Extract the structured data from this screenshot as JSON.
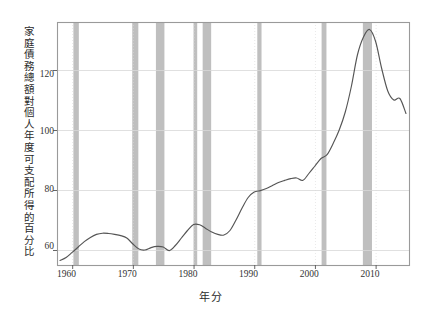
{
  "chart_data": {
    "type": "line",
    "title": "",
    "subtitle": "",
    "xlabel": "年分",
    "ylabel": "家庭債務總額對個人年度可支配所得的百分比",
    "xlim": [
      1957.5,
      2015.5
    ],
    "ylim": [
      55,
      136
    ],
    "grid": true,
    "legend": null,
    "xticks": [
      1960,
      1970,
      1980,
      1990,
      2000,
      2010
    ],
    "xtick_labels": [
      "1960",
      "1970",
      "1980",
      "1990",
      "2000",
      "2010"
    ],
    "yticks": [
      60,
      80,
      100,
      120
    ],
    "ytick_labels": [
      "60",
      "80",
      "100",
      "120"
    ],
    "series": [
      {
        "name": "家庭債務對可支配所得比",
        "color": "#555555",
        "x": [
          1958,
          1959,
          1960,
          1961,
          1962,
          1963,
          1964,
          1965,
          1966,
          1967,
          1968,
          1969,
          1970,
          1971,
          1972,
          1973,
          1974,
          1975,
          1976,
          1977,
          1978,
          1979,
          1980,
          1981,
          1982,
          1983,
          1984,
          1985,
          1986,
          1987,
          1988,
          1989,
          1990,
          1991,
          1992,
          1993,
          1994,
          1995,
          1996,
          1997,
          1998,
          1999,
          2000,
          2001,
          2002,
          2003,
          2004,
          2005,
          2006,
          2007,
          2008,
          2009,
          2010,
          2011,
          2012,
          2013,
          2014,
          2015
        ],
        "values": [
          56.5,
          57.5,
          59.2,
          61.0,
          62.8,
          64.2,
          65.2,
          65.6,
          65.5,
          65.2,
          64.8,
          64.0,
          62.0,
          60.3,
          60.0,
          60.8,
          61.2,
          61.0,
          59.8,
          61.5,
          64.0,
          66.5,
          68.5,
          68.4,
          67.2,
          66.0,
          65.2,
          65.0,
          66.5,
          70.0,
          74.0,
          77.5,
          79.3,
          79.8,
          80.5,
          81.5,
          82.5,
          83.2,
          83.8,
          84.0,
          83.2,
          85.5,
          88.0,
          90.5,
          91.8,
          95.5,
          100.0,
          106.0,
          114.5,
          125.0,
          131.0,
          133.5,
          129.5,
          120.5,
          113.0,
          110.0,
          110.5,
          105.5
        ],
        "peak": {
          "year": 2009,
          "value": 133.5
        },
        "final": {
          "year": 2015,
          "value": 104.5
        }
      }
    ],
    "recession_bands": {
      "color": "#b4b4b4",
      "opacity": 0.85,
      "label": "景氣衰退期",
      "spans": [
        [
          1960.2,
          1961.1
        ],
        [
          1969.9,
          1970.9
        ],
        [
          1973.8,
          1975.2
        ],
        [
          1980.0,
          1980.6
        ],
        [
          1981.5,
          1982.9
        ],
        [
          1990.5,
          1991.2
        ],
        [
          2001.1,
          2001.9
        ],
        [
          2007.9,
          2009.4
        ]
      ]
    },
    "colors": {
      "line": "#555555",
      "frame": "#9a9a9a",
      "grid": "#d8d8d8",
      "band": "#b4b4b4",
      "background": "#ffffff",
      "text": "#2b2b2b"
    }
  },
  "axes": {
    "y_tick_positions_px": [
      75.1,
      132.4,
      189.7,
      247.0
    ],
    "x_tick_positions_px": [
      66.5,
      127.2,
      187.9,
      248.6,
      309.3,
      370.0
    ],
    "plot_rect_px": {
      "left": 57,
      "top": 22,
      "right": 409,
      "bottom": 265
    }
  }
}
